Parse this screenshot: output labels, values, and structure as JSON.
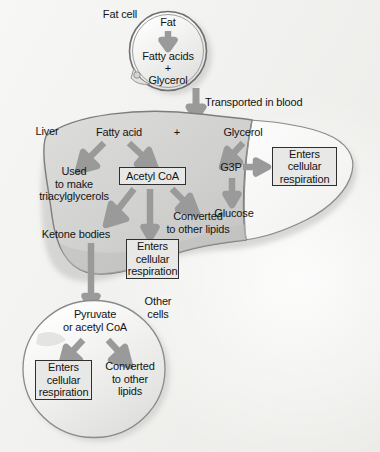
{
  "diagram": {
    "type": "biology-flow-diagram",
    "colors": {
      "background": "#f2f2f0",
      "arrow": "#9a9a9a",
      "liver_left_lobe": "#d2d2d0",
      "liver_right_lobe": "#fafafa",
      "cell_fill": "#ededeb",
      "box_fill": "#e8e8e6",
      "outline": "#6a6a6a",
      "text": "#141414"
    }
  },
  "fat_cell": {
    "label": "Fat cell",
    "contents": {
      "top": "Fat",
      "products_line1": "Fatty acids",
      "products_line2": "+",
      "products_line3": "Glycerol"
    }
  },
  "transport": {
    "label": "Transported in blood"
  },
  "liver": {
    "label": "Liver",
    "inputs": {
      "fatty_acid": "Fatty acid",
      "plus": "+",
      "glycerol": "Glycerol"
    },
    "nodes": {
      "used_to_make": "Used\nto make\ntriacylglycerols",
      "acetyl_coa": "Acetyl CoA",
      "converted_lipids": "Converted\nto other lipids",
      "ketone_bodies": "Ketone bodies",
      "g3p": "G3P",
      "glucose": "Glucose"
    },
    "boxes": {
      "enters_respiration_right": "Enters\ncellular\nrespiration",
      "enters_respiration_center": "Enters\ncellular\nrespiration"
    }
  },
  "other_cells": {
    "label": "Other\ncells",
    "nodes": {
      "pyruvate": "Pyruvate\nor acetyl CoA",
      "converted_lipids": "Converted\nto other\nlipids"
    },
    "boxes": {
      "enters_respiration": "Enters\ncellular\nrespiration"
    }
  }
}
